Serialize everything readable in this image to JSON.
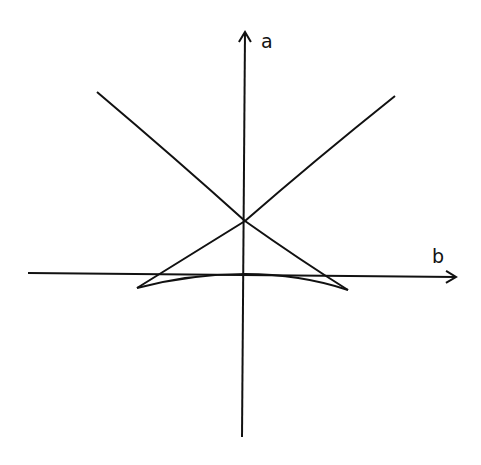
{
  "figure": {
    "type": "swallowtail / discriminant curve sketch",
    "axes": {
      "vertical_label": "a",
      "horizontal_label": "b"
    },
    "colors": {
      "ink": "#111111",
      "background": "#ffffff"
    },
    "features": {
      "self_intersection": "on the a-axis, above the b-axis",
      "cusps": [
        "left cusp slightly below b-axis",
        "right cusp slightly below b-axis"
      ],
      "bottom_arc": "shallow arc joining the two cusps, touching the origin"
    }
  }
}
